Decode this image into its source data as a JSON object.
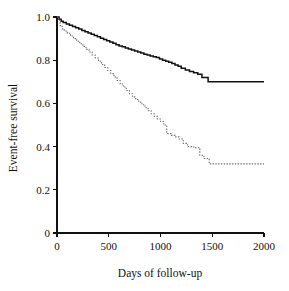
{
  "chart_data": {
    "type": "line",
    "title": "",
    "subtitle": "",
    "xlabel": "Days of follow-up",
    "ylabel": "Event-free survival",
    "xlim": [
      0,
      2000
    ],
    "ylim": [
      0,
      1.0
    ],
    "xticks": [
      0,
      500,
      1000,
      1500,
      2000
    ],
    "xtick_labels": [
      "0",
      "500",
      "1000",
      "1500",
      "2000"
    ],
    "yticks": [
      0,
      0.2,
      0.4,
      0.6,
      0.8,
      1.0
    ],
    "ytick_labels": [
      "0",
      "0.2",
      "0.4",
      "0.6",
      "0.8",
      "1.0"
    ],
    "grid": false,
    "legend": null,
    "legend_position": "none",
    "annotations": [],
    "series": [
      {
        "name": "upper-survival-curve",
        "style": "solid",
        "color": "#111111",
        "plateau_value": 0.7,
        "plateau_start_x": 1460,
        "x": [
          0,
          20,
          40,
          60,
          90,
          120,
          150,
          180,
          210,
          240,
          270,
          300,
          330,
          360,
          390,
          420,
          450,
          480,
          510,
          540,
          570,
          600,
          630,
          660,
          690,
          720,
          750,
          780,
          810,
          840,
          870,
          900,
          930,
          960,
          990,
          1020,
          1050,
          1080,
          1110,
          1140,
          1170,
          1200,
          1240,
          1280,
          1320,
          1360,
          1400,
          1460,
          2000
        ],
        "y": [
          1.0,
          0.99,
          0.98,
          0.975,
          0.968,
          0.962,
          0.956,
          0.95,
          0.944,
          0.938,
          0.932,
          0.926,
          0.92,
          0.914,
          0.908,
          0.902,
          0.896,
          0.89,
          0.884,
          0.878,
          0.872,
          0.866,
          0.862,
          0.857,
          0.852,
          0.847,
          0.843,
          0.838,
          0.833,
          0.828,
          0.824,
          0.82,
          0.816,
          0.812,
          0.806,
          0.8,
          0.795,
          0.79,
          0.785,
          0.778,
          0.772,
          0.763,
          0.755,
          0.748,
          0.742,
          0.735,
          0.72,
          0.7,
          0.7
        ]
      },
      {
        "name": "lower-survival-curve",
        "style": "dotted",
        "color": "#6e6e6e",
        "plateau_value": 0.32,
        "plateau_start_x": 1470,
        "x": [
          0,
          15,
          30,
          50,
          70,
          100,
          130,
          160,
          190,
          220,
          250,
          280,
          310,
          340,
          370,
          400,
          430,
          460,
          490,
          520,
          550,
          580,
          610,
          640,
          670,
          700,
          730,
          760,
          790,
          820,
          850,
          880,
          910,
          940,
          970,
          1000,
          1030,
          1060,
          1100,
          1140,
          1180,
          1220,
          1260,
          1300,
          1340,
          1380,
          1420,
          1470,
          2000
        ],
        "y": [
          1.0,
          0.985,
          0.96,
          0.945,
          0.935,
          0.925,
          0.912,
          0.9,
          0.888,
          0.876,
          0.864,
          0.85,
          0.838,
          0.824,
          0.81,
          0.795,
          0.78,
          0.766,
          0.752,
          0.738,
          0.722,
          0.706,
          0.69,
          0.676,
          0.66,
          0.645,
          0.63,
          0.618,
          0.606,
          0.594,
          0.58,
          0.566,
          0.552,
          0.54,
          0.528,
          0.516,
          0.5,
          0.46,
          0.452,
          0.445,
          0.435,
          0.415,
          0.4,
          0.398,
          0.395,
          0.36,
          0.345,
          0.32,
          0.32
        ]
      }
    ]
  },
  "figure": {
    "background_color": "#ffffff",
    "axis_color": "#111111"
  }
}
